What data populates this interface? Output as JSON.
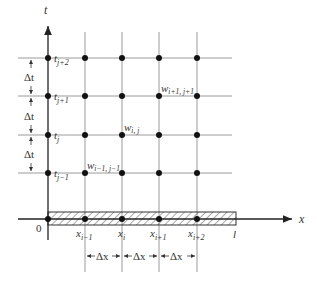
{
  "axes": {
    "t_label": "t",
    "x_label": "x",
    "origin_label": "0",
    "end_label": "l"
  },
  "time_levels": [
    {
      "label": "t",
      "sub": "j+2"
    },
    {
      "label": "t",
      "sub": "j+1"
    },
    {
      "label": "t",
      "sub": "j"
    },
    {
      "label": "t",
      "sub": "j−1"
    }
  ],
  "space_nodes": [
    {
      "label": "x",
      "sub": "i−1"
    },
    {
      "label": "x",
      "sub": "i"
    },
    {
      "label": "x",
      "sub": "i+1"
    },
    {
      "label": "x",
      "sub": "i+2"
    }
  ],
  "point_labels": [
    {
      "label": "w",
      "sub": "i+1, j+1"
    },
    {
      "label": "w",
      "sub": "i, j"
    },
    {
      "label": "w",
      "sub": "i−1, j−1"
    }
  ],
  "dimensions": {
    "dt": "Δt",
    "dx": "Δx"
  },
  "colors": {
    "axis": "#222222",
    "grid": "#9a9a9a",
    "node": "#111111",
    "text": "#333333"
  }
}
